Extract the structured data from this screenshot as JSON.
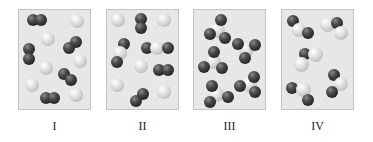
{
  "figure": {
    "colors": {
      "panel_background": "#e7e7e7",
      "panel_border": "#c4c4c4",
      "dark_atom": "#2a2a2a",
      "light_atom": "#d6d6d6"
    },
    "panels": [
      {
        "label": "I",
        "contents": "mixture of diatomic dark molecules and single light atoms",
        "molecules": [
          {
            "type": "diatomic-dark",
            "count": 4
          },
          {
            "type": "monatomic-light",
            "count": 6
          }
        ]
      },
      {
        "label": "II",
        "contents": "mixture of diatomic dark molecules, single light atoms, and triatomic molecules",
        "molecules": [
          {
            "type": "diatomic-dark",
            "count": 3
          },
          {
            "type": "monatomic-light",
            "count": 5
          },
          {
            "type": "triatomic-dark-light-dark",
            "count": 2
          }
        ]
      },
      {
        "label": "III",
        "contents": "identical molecules, one light central atom bonded to three dark atoms",
        "molecules": [
          {
            "type": "AB3-light-center-dark-outer",
            "count": 5
          }
        ]
      },
      {
        "label": "IV",
        "contents": "identical bent molecules of one dark atom and two light atoms",
        "molecules": [
          {
            "type": "bent-triatomic-dark-light-light",
            "count": 5
          }
        ]
      }
    ]
  }
}
